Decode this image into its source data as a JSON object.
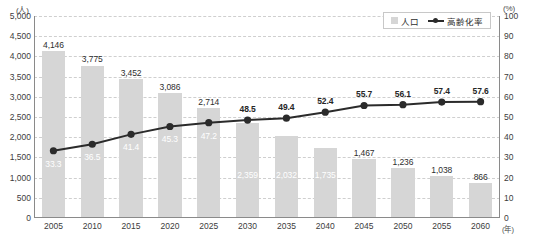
{
  "chart_data": {
    "type": "bar",
    "title": "",
    "xlabel": "年",
    "ylabel": "人",
    "y2label": "%",
    "ylim": [
      0,
      5000
    ],
    "y2lim": [
      0,
      100
    ],
    "ytick_step": 500,
    "y2tick_step": 10,
    "grid": true,
    "legend_position": "top-right",
    "categories": [
      "2005",
      "2010",
      "2015",
      "2020",
      "2025",
      "2030",
      "2035",
      "2040",
      "2045",
      "2050",
      "2055",
      "2060"
    ],
    "yticks": [
      "0",
      "500",
      "1,000",
      "1,500",
      "2,000",
      "2,500",
      "3,000",
      "3,500",
      "4,000",
      "4,500",
      "5,000"
    ],
    "y2ticks": [
      "0",
      "10",
      "20",
      "30",
      "40",
      "50",
      "60",
      "70",
      "80",
      "90",
      "100"
    ],
    "series": [
      {
        "name": "人口",
        "type": "bar",
        "axis": "left",
        "color": "#d6d6d6",
        "values": [
          4146,
          3775,
          3452,
          3086,
          2714,
          2359,
          2032,
          1735,
          1467,
          1236,
          1038,
          866
        ],
        "labels": [
          "4,146",
          "3,775",
          "3,452",
          "3,086",
          "2,714",
          "2,359",
          "2,032",
          "1,735",
          "1,467",
          "1,236",
          "1,038",
          "866"
        ],
        "label_placement": [
          "outside",
          "outside",
          "outside",
          "outside",
          "outside",
          "inside",
          "inside",
          "inside",
          "outside",
          "outside",
          "outside",
          "outside"
        ]
      },
      {
        "name": "高齢化率",
        "type": "line",
        "axis": "right",
        "color": "#2b2b2b",
        "values": [
          33.3,
          36.5,
          41.4,
          45.3,
          47.2,
          48.5,
          49.4,
          52.4,
          55.7,
          56.1,
          57.4,
          57.6
        ],
        "labels": [
          "33.3",
          "36.5",
          "41.4",
          "45.3",
          "47.2",
          "48.5",
          "49.4",
          "52.4",
          "55.7",
          "56.1",
          "57.4",
          "57.6"
        ],
        "label_placement": [
          "inside",
          "inside",
          "inside",
          "inside",
          "inside",
          "outside",
          "outside",
          "outside",
          "outside",
          "outside",
          "outside",
          "outside"
        ]
      }
    ]
  },
  "legend": {
    "items": [
      {
        "label": "人口",
        "marker": "square-swatch"
      },
      {
        "label": "高齢化率",
        "marker": "line-with-dot"
      }
    ]
  },
  "axes": {
    "left_unit": "(人)",
    "right_unit": "(%)",
    "x_unit": "(年)"
  }
}
